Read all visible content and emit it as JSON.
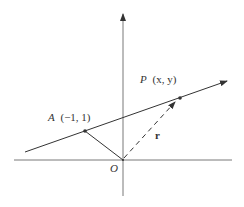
{
  "diagram": {
    "labels": {
      "origin": "O",
      "point_a_name": "A",
      "point_a_coords": "(−1, 1)",
      "point_p_name": "P",
      "point_p_coords": "(x, y)",
      "vector_r": "r"
    },
    "colors": {
      "stroke": "#333333",
      "background": "#ffffff"
    }
  }
}
